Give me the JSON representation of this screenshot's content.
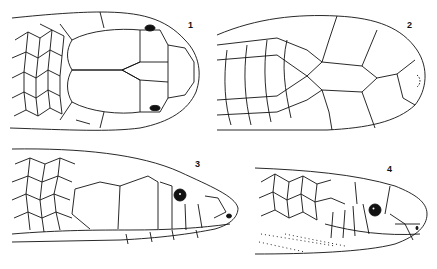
{
  "figure": {
    "panels": [
      {
        "id": "1",
        "label": "1",
        "view": "dorsal view of snake head"
      },
      {
        "id": "2",
        "label": "2",
        "view": "ventral view of snake head"
      },
      {
        "id": "3",
        "label": "3",
        "view": "lateral view of snake head"
      },
      {
        "id": "4",
        "label": "4",
        "view": "lateral view of snake head"
      }
    ],
    "colors": {
      "ink": "#111111",
      "background": "#ffffff"
    }
  }
}
